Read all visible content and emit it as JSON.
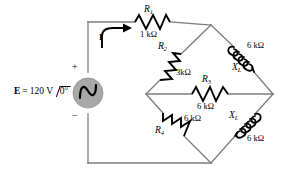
{
  "diagram": {
    "line_color": "#7d7d7d",
    "component_color": "#000000",
    "source_fill": "#a8a8a8"
  },
  "source": {
    "name": "voltage-source",
    "label_E": "E",
    "label_eq": "=",
    "label_value": "120 V",
    "label_angle": "0°",
    "plus": "+",
    "minus": "−",
    "full_label": "E = 120 V ∠0°"
  },
  "current": {
    "symbol": "I",
    "direction": "clockwise-right"
  },
  "components": [
    {
      "id": "R1",
      "name": "resistor-r1",
      "type": "resistor",
      "ref": "R",
      "sub": "1",
      "value": "1 kΩ",
      "position": "top-horizontal"
    },
    {
      "id": "R2",
      "name": "resistor-r2",
      "type": "resistor",
      "ref": "R",
      "sub": "2",
      "value": "3kΩ",
      "position": "upper-left-diagonal"
    },
    {
      "id": "XL1",
      "name": "inductor-xl-upper",
      "type": "inductor",
      "ref": "X",
      "sub": "L",
      "value": "6 kΩ",
      "position": "upper-right-diagonal"
    },
    {
      "id": "R3",
      "name": "resistor-r3",
      "type": "resistor",
      "ref": "R",
      "sub": "3",
      "value": "6 kΩ",
      "position": "middle-bridge-horizontal"
    },
    {
      "id": "R4",
      "name": "resistor-r4",
      "type": "resistor",
      "ref": "R",
      "sub": "4",
      "value": "6 kΩ",
      "position": "lower-left-diagonal"
    },
    {
      "id": "XL2",
      "name": "inductor-xl-lower",
      "type": "inductor",
      "ref": "X",
      "sub": "L",
      "value": "6 kΩ",
      "position": "lower-right-diagonal"
    }
  ]
}
